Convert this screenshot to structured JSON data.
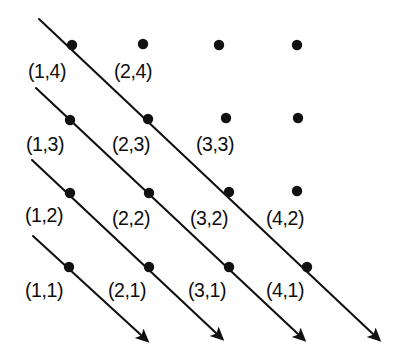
{
  "figure": {
    "canvas": {
      "width": 393,
      "height": 358
    },
    "background_color": "#ffffff",
    "ink_color": "#111111"
  },
  "chart_data": {
    "type": "scatter",
    "subtitle": "",
    "xlabel": "",
    "ylabel": "",
    "grid": false,
    "legend_position": "none",
    "xlim": [
      1,
      4
    ],
    "ylim": [
      1,
      4
    ],
    "x_tick_labels": [
      "1",
      "2",
      "3",
      "4"
    ],
    "y_tick_labels": [
      "1",
      "2",
      "3",
      "4"
    ],
    "points": [
      {
        "x": 1,
        "y": 4,
        "label": "(1,4)",
        "px": 72,
        "py": 45,
        "labeled": true,
        "label_x": 28,
        "label_y": 62
      },
      {
        "x": 2,
        "y": 4,
        "label": "(2,4)",
        "px": 143,
        "py": 44,
        "labeled": true,
        "label_x": 114,
        "label_y": 62
      },
      {
        "x": 3,
        "y": 4,
        "label": "",
        "px": 219,
        "py": 45,
        "labeled": false,
        "label_x": 0,
        "label_y": 0
      },
      {
        "x": 4,
        "y": 4,
        "label": "",
        "px": 297,
        "py": 45,
        "labeled": false,
        "label_x": 0,
        "label_y": 0
      },
      {
        "x": 1,
        "y": 3,
        "label": "(1,3)",
        "px": 70,
        "py": 120,
        "labeled": true,
        "label_x": 26,
        "label_y": 135
      },
      {
        "x": 2,
        "y": 3,
        "label": "(2,3)",
        "px": 148,
        "py": 119,
        "labeled": true,
        "label_x": 112,
        "label_y": 135
      },
      {
        "x": 3,
        "y": 3,
        "label": "(3,3)",
        "px": 226,
        "py": 118,
        "labeled": true,
        "label_x": 196,
        "label_y": 135
      },
      {
        "x": 4,
        "y": 3,
        "label": "",
        "px": 298,
        "py": 118,
        "labeled": false,
        "label_x": 0,
        "label_y": 0
      },
      {
        "x": 1,
        "y": 2,
        "label": "(1,2)",
        "px": 70,
        "py": 193,
        "labeled": true,
        "label_x": 25,
        "label_y": 206
      },
      {
        "x": 2,
        "y": 2,
        "label": "(2,2)",
        "px": 149,
        "py": 193,
        "labeled": true,
        "label_x": 112,
        "label_y": 209
      },
      {
        "x": 3,
        "y": 2,
        "label": "(3,2)",
        "px": 229,
        "py": 192,
        "labeled": true,
        "label_x": 190,
        "label_y": 209
      },
      {
        "x": 4,
        "y": 2,
        "label": "(4,2)",
        "px": 297,
        "py": 191,
        "labeled": true,
        "label_x": 266,
        "label_y": 209
      },
      {
        "x": 1,
        "y": 1,
        "label": "(1,1)",
        "px": 69,
        "py": 267,
        "labeled": true,
        "label_x": 25,
        "label_y": 281
      },
      {
        "x": 2,
        "y": 1,
        "label": "(2,1)",
        "px": 149,
        "py": 267,
        "labeled": true,
        "label_x": 108,
        "label_y": 281
      },
      {
        "x": 3,
        "y": 1,
        "label": "(3,1)",
        "px": 229,
        "py": 267,
        "labeled": true,
        "label_x": 188,
        "label_y": 281
      },
      {
        "x": 4,
        "y": 1,
        "label": "(4,1)",
        "px": 307,
        "py": 267,
        "labeled": true,
        "label_x": 266,
        "label_y": 281
      }
    ],
    "diagonals": [
      {
        "name": "diagonal-1",
        "passes_through": [
          "(1,4)",
          "(2,3)",
          "(3,2)",
          "(4,1)"
        ],
        "x1": 39,
        "y1": 19,
        "x2": 373,
        "y2": 334
      },
      {
        "name": "diagonal-2",
        "passes_through": [
          "(1,3)",
          "(2,2)",
          "(3,1)"
        ],
        "x1": 36,
        "y1": 88,
        "x2": 298,
        "y2": 334
      },
      {
        "name": "diagonal-3",
        "passes_through": [
          "(1,2)",
          "(2,1)"
        ],
        "x1": 32,
        "y1": 160,
        "x2": 216,
        "y2": 333
      },
      {
        "name": "diagonal-4",
        "passes_through": [
          "(1,1)"
        ],
        "x1": 33,
        "y1": 236,
        "x2": 141,
        "y2": 335
      }
    ],
    "dot_radius": 5.2,
    "point_count": 16,
    "labeled_point_count": 14,
    "diagonal_count": 4
  }
}
